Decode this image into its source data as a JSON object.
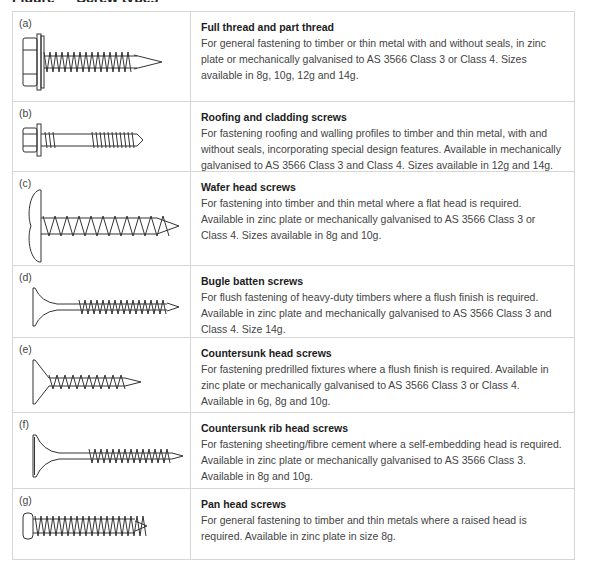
{
  "title_fragment": "Figure — Screw types",
  "rows": [
    {
      "label": "(a)",
      "icon": "hex-head-sealed-screw-icon",
      "heading": "Full thread and part thread",
      "description": "For general fastening to timber or thin metal with and without seals, in zinc plate or mechanically galvanised to AS 3566 Class 3 or Class 4. Sizes available in 8g, 10g, 12g and 14g.",
      "height": 90
    },
    {
      "label": "(b)",
      "icon": "roofing-screw-icon",
      "heading": "Roofing and cladding screws",
      "description": "For fastening roofing and walling profiles to timber and thin metal, with and without seals, incorporating special design features. Available in mechanically galvanised to AS 3566 Class 3 and Class 4. Sizes available in 12g and 14g.",
      "height": 70
    },
    {
      "label": "(c)",
      "icon": "wafer-head-screw-icon",
      "heading": "Wafer head screws",
      "description": "For fastening into timber and thin metal where a flat head is required. Available in zinc plate or mechanically galvanised to AS 3566 Class 3 or Class 4. Sizes available in 8g and 10g.",
      "height": 94
    },
    {
      "label": "(d)",
      "icon": "bugle-batten-screw-icon",
      "heading": "Bugle batten screws",
      "description": "For flush fastening of heavy-duty timbers where a flush finish is required. Available in zinc plate and mechanically galvanised to AS 3566 Class 3 and Class 4. Size 14g.",
      "height": 72
    },
    {
      "label": "(e)",
      "icon": "countersunk-head-screw-icon",
      "heading": "Countersunk head screws",
      "description": "For fastening predrilled fixtures where a flush finish is required. Available in zinc plate or mechanically galvanised to AS 3566 Class 3 or Class 4. Available in 6g, 8g and 10g.",
      "height": 75
    },
    {
      "label": "(f)",
      "icon": "countersunk-rib-head-screw-icon",
      "heading": "Countersunk rib head screws",
      "description": "For fastening sheeting/fibre cement where a self-embedding head is required. Available in zinc plate or mechanically galvanised to AS 3566 Class 3. Available in 8g and 10g.",
      "height": 76
    },
    {
      "label": "(g)",
      "icon": "pan-head-screw-icon",
      "heading": "Pan head screws",
      "description": "For general fastening to timber and thin metals where a raised head is required. Available in zinc plate in size 8g.",
      "height": 70
    }
  ]
}
